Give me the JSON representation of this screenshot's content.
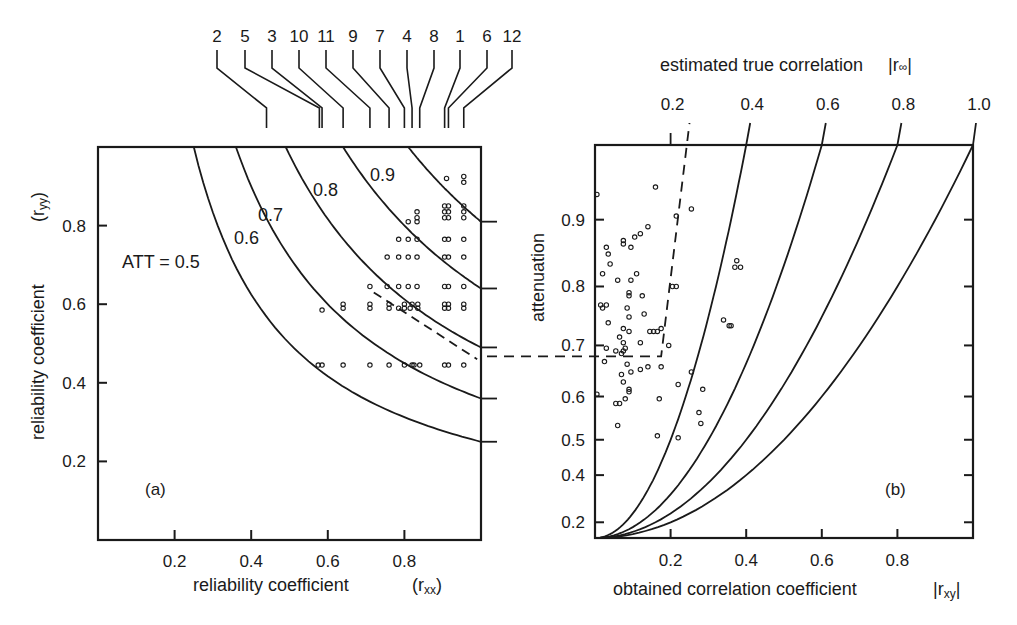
{
  "chart_data": [
    {
      "panel": "(a)",
      "type": "scatter",
      "xlabel": "reliability coefficient (rxx)",
      "ylabel": "reliability coefficient (ryy)",
      "xlim": [
        0,
        1.0
      ],
      "ylim": [
        0,
        1.0
      ],
      "x_ticks": [
        0.2,
        0.4,
        0.6,
        0.8
      ],
      "y_ticks": [
        0.2,
        0.4,
        0.6,
        0.8
      ],
      "curves": {
        "description": "iso-attenuation curves ATT = sqrt(rxx*ryy)",
        "labels": [
          "ATT = 0.5",
          "0.6",
          "0.7",
          "0.8",
          "0.9"
        ],
        "values": [
          0.5,
          0.6,
          0.7,
          0.8,
          0.9
        ]
      },
      "study_labels_top": [
        "2",
        "5",
        "3",
        "10",
        "11",
        "9",
        "7",
        "4",
        "8",
        "1",
        "6",
        "12"
      ],
      "study_rxx": [
        0.44,
        0.578,
        0.585,
        0.64,
        0.71,
        0.76,
        0.8,
        0.82,
        0.84,
        0.905,
        0.915,
        0.955
      ],
      "points": [
        [
          0.91,
          0.92
        ],
        [
          0.955,
          0.925
        ],
        [
          0.955,
          0.91
        ],
        [
          0.905,
          0.85
        ],
        [
          0.915,
          0.85
        ],
        [
          0.905,
          0.835
        ],
        [
          0.915,
          0.835
        ],
        [
          0.905,
          0.82
        ],
        [
          0.915,
          0.82
        ],
        [
          0.955,
          0.85
        ],
        [
          0.955,
          0.835
        ],
        [
          0.955,
          0.82
        ],
        [
          0.833,
          0.835
        ],
        [
          0.81,
          0.81
        ],
        [
          0.833,
          0.81
        ],
        [
          0.833,
          0.82
        ],
        [
          0.785,
          0.765
        ],
        [
          0.81,
          0.765
        ],
        [
          0.833,
          0.765
        ],
        [
          0.905,
          0.765
        ],
        [
          0.915,
          0.765
        ],
        [
          0.955,
          0.765
        ],
        [
          0.755,
          0.72
        ],
        [
          0.785,
          0.72
        ],
        [
          0.81,
          0.72
        ],
        [
          0.833,
          0.72
        ],
        [
          0.905,
          0.72
        ],
        [
          0.915,
          0.72
        ],
        [
          0.955,
          0.72
        ],
        [
          0.71,
          0.645
        ],
        [
          0.755,
          0.645
        ],
        [
          0.785,
          0.645
        ],
        [
          0.81,
          0.645
        ],
        [
          0.833,
          0.645
        ],
        [
          0.905,
          0.645
        ],
        [
          0.915,
          0.645
        ],
        [
          0.955,
          0.645
        ],
        [
          0.585,
          0.585
        ],
        [
          0.64,
          0.59
        ],
        [
          0.64,
          0.6
        ],
        [
          0.71,
          0.59
        ],
        [
          0.71,
          0.6
        ],
        [
          0.76,
          0.59
        ],
        [
          0.76,
          0.6
        ],
        [
          0.785,
          0.59
        ],
        [
          0.8,
          0.6
        ],
        [
          0.8,
          0.59
        ],
        [
          0.815,
          0.59
        ],
        [
          0.82,
          0.6
        ],
        [
          0.835,
          0.59
        ],
        [
          0.835,
          0.6
        ],
        [
          0.905,
          0.59
        ],
        [
          0.905,
          0.6
        ],
        [
          0.915,
          0.59
        ],
        [
          0.915,
          0.6
        ],
        [
          0.955,
          0.59
        ],
        [
          0.955,
          0.6
        ],
        [
          0.575,
          0.445
        ],
        [
          0.585,
          0.445
        ],
        [
          0.64,
          0.445
        ],
        [
          0.71,
          0.445
        ],
        [
          0.76,
          0.445
        ],
        [
          0.8,
          0.445
        ],
        [
          0.82,
          0.445
        ],
        [
          0.825,
          0.445
        ],
        [
          0.84,
          0.445
        ],
        [
          0.905,
          0.445
        ],
        [
          0.915,
          0.445
        ],
        [
          0.955,
          0.445
        ]
      ],
      "dashed_line": [
        [
          0.72,
          0.63
        ],
        [
          0.99,
          0.46
        ]
      ],
      "annotation": "(a)"
    },
    {
      "panel": "(b)",
      "type": "scatter",
      "title": "estimated true correlation |r∞|",
      "xlabel": "obtained correlation coefficient |rxy|",
      "ylabel": "attenuation",
      "xlim": [
        0,
        1.0
      ],
      "ylim": [
        0,
        1.0
      ],
      "y_scale": "squared (position proportional to attenuation^2)",
      "x_ticks": [
        0.2,
        0.4,
        0.6,
        0.8
      ],
      "y_ticks": [
        0.2,
        0.4,
        0.5,
        0.6,
        0.7,
        0.8,
        0.9
      ],
      "curves": {
        "description": "rxy = r∞ × attenuation",
        "labels": [
          "0.2",
          "0.4",
          "0.6",
          "0.8",
          "1.0"
        ],
        "values": [
          0.2,
          0.4,
          0.6,
          0.8,
          1.0
        ],
        "dashed": [
          true,
          false,
          false,
          false,
          false
        ]
      },
      "points": [
        [
          0.005,
          0.935
        ],
        [
          0.16,
          0.945
        ],
        [
          0.215,
          0.905
        ],
        [
          0.255,
          0.915
        ],
        [
          0.14,
          0.89
        ],
        [
          0.12,
          0.88
        ],
        [
          0.105,
          0.875
        ],
        [
          0.075,
          0.87
        ],
        [
          0.075,
          0.865
        ],
        [
          0.095,
          0.86
        ],
        [
          0.03,
          0.86
        ],
        [
          0.035,
          0.85
        ],
        [
          0.04,
          0.835
        ],
        [
          0.02,
          0.82
        ],
        [
          0.06,
          0.81
        ],
        [
          0.095,
          0.81
        ],
        [
          0.11,
          0.82
        ],
        [
          0.205,
          0.8
        ],
        [
          0.215,
          0.8
        ],
        [
          0.09,
          0.79
        ],
        [
          0.09,
          0.785
        ],
        [
          0.125,
          0.785
        ],
        [
          0.015,
          0.77
        ],
        [
          0.02,
          0.765
        ],
        [
          0.03,
          0.77
        ],
        [
          0.085,
          0.765
        ],
        [
          0.13,
          0.755
        ],
        [
          0.09,
          0.75
        ],
        [
          0.035,
          0.74
        ],
        [
          0.075,
          0.73
        ],
        [
          0.09,
          0.725
        ],
        [
          0.145,
          0.725
        ],
        [
          0.155,
          0.725
        ],
        [
          0.165,
          0.725
        ],
        [
          0.175,
          0.73
        ],
        [
          0.065,
          0.715
        ],
        [
          0.075,
          0.705
        ],
        [
          0.075,
          0.69
        ],
        [
          0.07,
          0.685
        ],
        [
          0.08,
          0.695
        ],
        [
          0.12,
          0.705
        ],
        [
          0.195,
          0.7
        ],
        [
          0.03,
          0.695
        ],
        [
          0.055,
          0.69
        ],
        [
          0.025,
          0.67
        ],
        [
          0.085,
          0.665
        ],
        [
          0.14,
          0.66
        ],
        [
          0.175,
          0.66
        ],
        [
          0.07,
          0.645
        ],
        [
          0.095,
          0.65
        ],
        [
          0.12,
          0.655
        ],
        [
          0.22,
          0.625
        ],
        [
          0.255,
          0.65
        ],
        [
          0.075,
          0.63
        ],
        [
          0.09,
          0.615
        ],
        [
          0.09,
          0.61
        ],
        [
          0.005,
          0.605
        ],
        [
          0.08,
          0.595
        ],
        [
          0.065,
          0.585
        ],
        [
          0.055,
          0.585
        ],
        [
          0.17,
          0.595
        ],
        [
          0.275,
          0.565
        ],
        [
          0.285,
          0.615
        ],
        [
          0.06,
          0.535
        ],
        [
          0.165,
          0.51
        ],
        [
          0.22,
          0.505
        ],
        [
          0.28,
          0.54
        ],
        [
          0.34,
          0.745
        ],
        [
          0.355,
          0.735
        ],
        [
          0.36,
          0.735
        ],
        [
          0.375,
          0.84
        ],
        [
          0.37,
          0.83
        ],
        [
          0.385,
          0.83
        ]
      ],
      "dashed_connector": {
        "attenuation": 0.68,
        "rxy": 0.175
      },
      "annotation": "(b)"
    }
  ],
  "labels": {
    "panel_a": "(a)",
    "panel_b": "(b)",
    "att_prefix": "ATT = 0.5",
    "a_xlabel": "reliability coefficient",
    "a_xsub": "(r",
    "a_xsubscript": "xx",
    "a_ylabel": "reliability coefficient",
    "a_ysubscript": "yy",
    "b_title": "estimated true correlation",
    "b_title_sym": "|r∞|",
    "b_xlabel": "obtained correlation coefficient",
    "b_xsubscript": "xy",
    "b_ylabel": "attenuation"
  }
}
